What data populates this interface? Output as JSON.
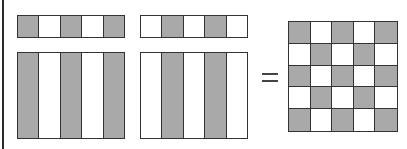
{
  "diagram": {
    "colors": {
      "filled": "#a9a9a9",
      "empty": "#ffffff",
      "stroke": "#333333"
    },
    "operator": "=",
    "matrix_a": {
      "strip": [
        "gray",
        "white",
        "gray",
        "white",
        "gray"
      ],
      "block": [
        "gray",
        "white",
        "gray",
        "white",
        "gray"
      ]
    },
    "matrix_b": {
      "strip": [
        "white",
        "gray",
        "white",
        "gray",
        "white"
      ],
      "block": [
        "white",
        "gray",
        "white",
        "gray",
        "white"
      ]
    },
    "result_grid": [
      [
        "gray",
        "white",
        "gray",
        "white",
        "gray"
      ],
      [
        "white",
        "gray",
        "white",
        "gray",
        "white"
      ],
      [
        "gray",
        "white",
        "gray",
        "white",
        "gray"
      ],
      [
        "white",
        "gray",
        "white",
        "gray",
        "white"
      ],
      [
        "gray",
        "white",
        "gray",
        "white",
        "gray"
      ]
    ]
  }
}
